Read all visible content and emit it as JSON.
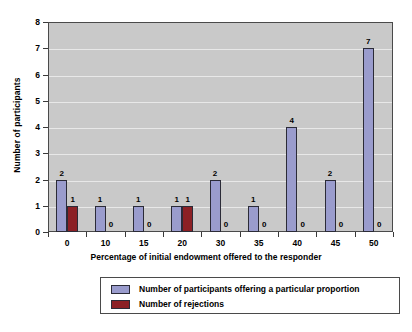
{
  "chart_data": {
    "type": "bar",
    "title": "",
    "xlabel": "Percentage of initial endowment offered to the responder",
    "ylabel": "Number of participants",
    "categories": [
      "0",
      "10",
      "15",
      "20",
      "30",
      "35",
      "40",
      "45",
      "50"
    ],
    "series": [
      {
        "name": "Number of participants offering a particular proportion",
        "color": "#9a9ccd",
        "values": [
          2,
          1,
          1,
          1,
          2,
          1,
          4,
          2,
          7
        ]
      },
      {
        "name": "Number of rejections",
        "color": "#8c2025",
        "values": [
          1,
          0,
          0,
          1,
          0,
          0,
          0,
          0,
          0
        ]
      }
    ],
    "ylim": [
      0,
      8
    ],
    "yticks": [
      "0",
      "1",
      "2",
      "3",
      "4",
      "5",
      "6",
      "7",
      "8"
    ],
    "grid": true,
    "legend_position": "bottom",
    "plot_background": "#c9c9c9",
    "show_value_labels": true
  }
}
